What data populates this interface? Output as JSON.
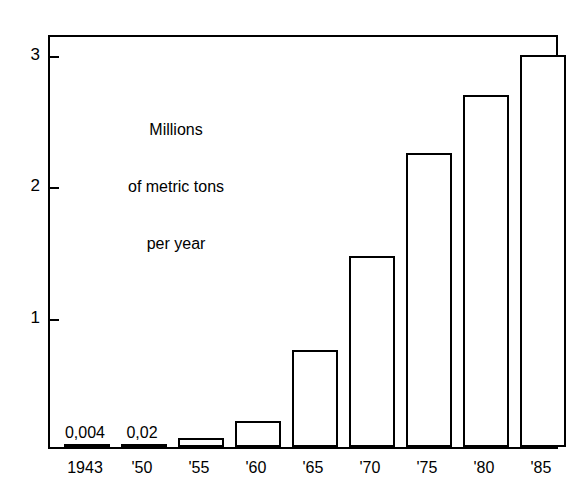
{
  "chart_data": {
    "type": "bar",
    "title": "",
    "subtitle": "",
    "xlabel": "",
    "ylabel": "Millions of metric tons per year",
    "ylabel_lines": [
      "Millions",
      "of metric tons",
      "per year"
    ],
    "categories": [
      "1943",
      "'50",
      "'55",
      "'60",
      "'65",
      "'70",
      "'75",
      "'80",
      "'85"
    ],
    "values": [
      0.004,
      0.02,
      0.07,
      0.2,
      0.74,
      1.45,
      2.24,
      2.68,
      2.98
    ],
    "point_labels": [
      "0,004",
      "0,02",
      "",
      "",
      "",
      "",
      "",
      "",
      ""
    ],
    "ylim": [
      0,
      3.15
    ],
    "yticks": [
      1,
      2,
      3
    ],
    "ytick_labels": [
      "1",
      "2",
      "3"
    ],
    "grid": false,
    "legend": false,
    "bar_fill": "#ffffff",
    "bar_stroke": "#000000",
    "axis_color": "#000000",
    "background": "#ffffff"
  },
  "annotations": {
    "decimal_separator": "comma"
  }
}
